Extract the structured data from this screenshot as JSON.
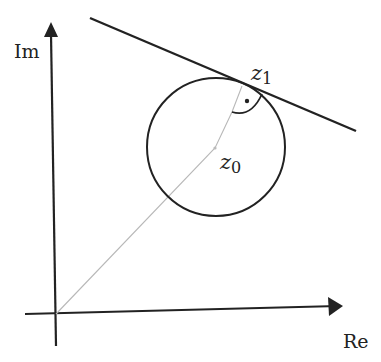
{
  "diagram": {
    "axes": {
      "x_label": "Re",
      "y_label": "Im"
    },
    "points": {
      "center": {
        "label": "z",
        "subscript": "0"
      },
      "tangent_point": {
        "label": "z",
        "subscript": "1"
      }
    },
    "annotations": {
      "right_angle_marker": "right angle between radius and tangent line"
    },
    "colors": {
      "ink": "#222222",
      "radius_line": "#b8b8b8",
      "background": "#ffffff"
    }
  }
}
